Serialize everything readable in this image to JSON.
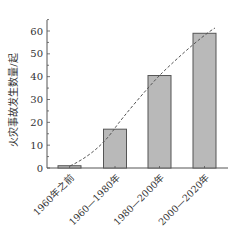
{
  "chart_data": {
    "type": "bar",
    "title": "",
    "xlabel": "",
    "ylabel": "火灾事故发生数量/起",
    "categories": [
      "1960年之前",
      "1960—1980年",
      "1980—2000年",
      "2000—2020年"
    ],
    "values": [
      1,
      17,
      40.5,
      59
    ],
    "ylim": [
      0,
      65
    ],
    "yticks": [
      0,
      10,
      20,
      30,
      40,
      50,
      60
    ],
    "grid": false,
    "legend": null,
    "overlay": {
      "type": "dashed-trend-curve",
      "description": "dashed trend line through bar tops"
    },
    "colors": {
      "bar_fill": "#b9b9b9",
      "bar_edge": "#555555",
      "axis": "#555555",
      "trend": "#555555"
    }
  }
}
